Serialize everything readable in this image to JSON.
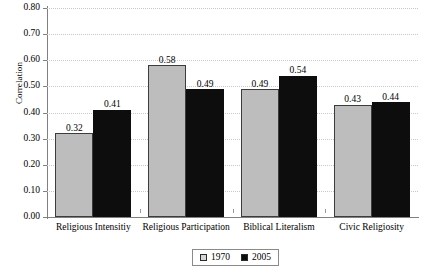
{
  "chart_data": {
    "type": "bar",
    "title": "",
    "xlabel": "",
    "ylabel": "Correlation",
    "ylim": [
      0.0,
      0.8
    ],
    "ytick_step": 0.1,
    "grid": true,
    "legend_position": "bottom",
    "categories": [
      "Religious Intensitiy",
      "Religious Participation",
      "Biblical Literalism",
      "Civic Religiosity"
    ],
    "series": [
      {
        "name": "1970",
        "color": "#bdbdbd",
        "values": [
          0.32,
          0.58,
          0.49,
          0.43
        ],
        "labels": [
          "0.32",
          "0.58",
          "0.49",
          "0.43"
        ]
      },
      {
        "name": "2005",
        "color": "#0d0d0d",
        "values": [
          0.41,
          0.49,
          0.54,
          0.44
        ],
        "labels": [
          "0.41",
          "0.49",
          "0.54",
          "0.44"
        ]
      }
    ],
    "ytick_labels": [
      "0.80",
      "0.70",
      "0.60",
      "0.50",
      "0.40",
      "0.30",
      "0.20",
      "0.10",
      "0.00"
    ],
    "ytick_values": [
      0.8,
      0.7,
      0.6,
      0.5,
      0.4,
      0.3,
      0.2,
      0.1,
      0.0
    ]
  },
  "legend": {
    "items": [
      {
        "label": "1970",
        "swatch": "gray-swatch"
      },
      {
        "label": "2005",
        "swatch": "black-swatch"
      }
    ]
  }
}
